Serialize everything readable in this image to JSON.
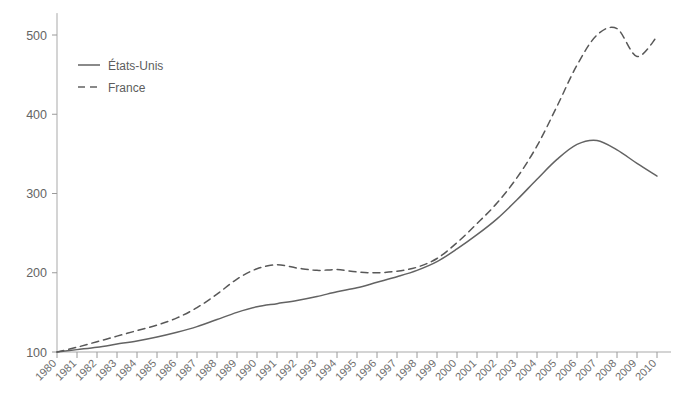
{
  "chart_data": {
    "type": "line",
    "title": "",
    "subtitle": "",
    "xlabel": "",
    "ylabel": "",
    "xlim": [
      1980,
      2010
    ],
    "ylim": [
      100,
      515
    ],
    "grid": false,
    "legend_position": "top-left",
    "x": [
      1980,
      1981,
      1982,
      1983,
      1984,
      1985,
      1986,
      1987,
      1988,
      1989,
      1990,
      1991,
      1992,
      1993,
      1994,
      1995,
      1996,
      1997,
      1998,
      1999,
      2000,
      2001,
      2002,
      2003,
      2004,
      2005,
      2006,
      2007,
      2008,
      2009,
      2010
    ],
    "xtick_labels": [
      "1980",
      "1981",
      "1982",
      "1983",
      "1984",
      "1985",
      "1986",
      "1987",
      "1988",
      "1989",
      "1990",
      "1991",
      "1992",
      "1993",
      "1994",
      "1995",
      "1996",
      "1997",
      "1998",
      "1999",
      "2000",
      "2001",
      "2002",
      "2003",
      "2004",
      "2005",
      "2006",
      "2007",
      "2008",
      "2009",
      "2010"
    ],
    "ytick_labels": [
      "100",
      "200",
      "300",
      "400",
      "500"
    ],
    "yticks": [
      100,
      200,
      300,
      400,
      500
    ],
    "series": [
      {
        "name": "États-Unis",
        "style": "solid",
        "color": "#636363",
        "values": [
          100,
          103,
          106,
          110,
          114,
          119,
          125,
          132,
          141,
          150,
          157,
          161,
          165,
          170,
          176,
          181,
          188,
          195,
          203,
          214,
          230,
          248,
          268,
          292,
          318,
          343,
          362,
          367,
          355,
          338,
          322
        ]
      },
      {
        "name": "France",
        "style": "dashed",
        "color": "#585858",
        "values": [
          100,
          106,
          113,
          120,
          127,
          134,
          143,
          156,
          173,
          192,
          205,
          210,
          206,
          203,
          204,
          201,
          200,
          202,
          207,
          218,
          238,
          262,
          288,
          320,
          360,
          410,
          462,
          500,
          508,
          473,
          498
        ]
      }
    ]
  },
  "legend": {
    "entries": [
      {
        "label": "États-Unis",
        "style": "solid"
      },
      {
        "label": "France",
        "style": "dashed"
      }
    ]
  },
  "axes": {
    "y_axis_name": "y-axis",
    "x_axis_name": "x-axis"
  }
}
